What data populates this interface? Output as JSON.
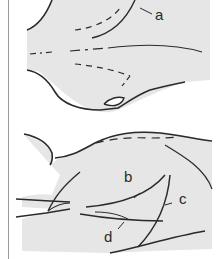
{
  "figure": {
    "colors": {
      "fill": "#e6e6e6",
      "stroke": "#2a2a2a",
      "background": "#ffffff",
      "frame": "#9a9a9a"
    },
    "top_panel": {
      "labels": [
        {
          "id": "a",
          "text": "a"
        }
      ]
    },
    "bottom_panel": {
      "labels": [
        {
          "id": "b",
          "text": "b"
        },
        {
          "id": "c",
          "text": "c"
        },
        {
          "id": "d",
          "text": "d"
        }
      ]
    }
  }
}
